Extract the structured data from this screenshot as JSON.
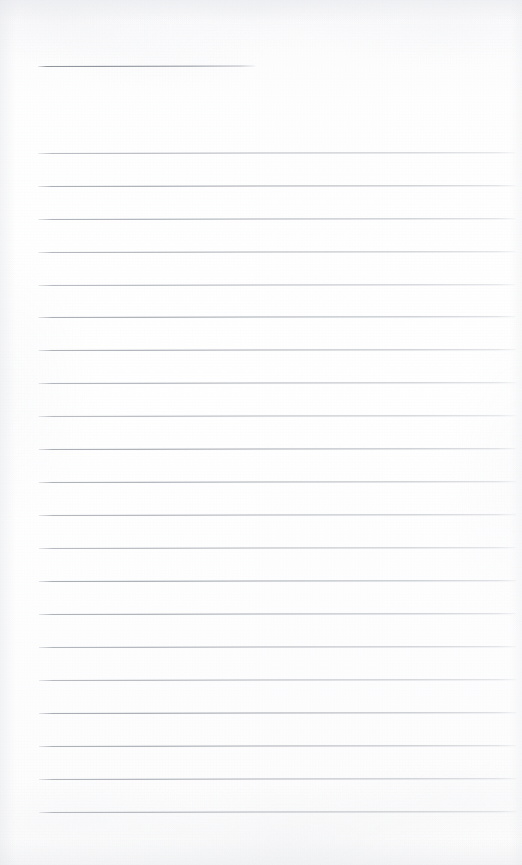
{
  "document": {
    "kind": "scanned-blank-lined-notebook-page",
    "page_width": 522,
    "page_height": 865,
    "background_color": "#fdfdfd",
    "rule_color": "#9ba0a8",
    "title_rule_color": "#868b95",
    "has_text": false,
    "text_content": "",
    "notes": "Blank ruled page. No printed words, numbers, headers, page numbers or handwriting are visible anywhere in the image."
  },
  "title_rule": {
    "name": "title-rule",
    "x": 38,
    "y": 66,
    "width": 217,
    "thickness": 1
  },
  "body_rules": {
    "left_x": 38,
    "right_x": 515,
    "width": 477,
    "spacing": 33,
    "thickness": 1,
    "count": 21,
    "y_positions": [
      153,
      186,
      219,
      252,
      285,
      317,
      350,
      383,
      416,
      449,
      482,
      515,
      548,
      581,
      614,
      647,
      680,
      713,
      746,
      779,
      812
    ]
  },
  "margins": {
    "top_blank": 66,
    "left": 38,
    "right": 7,
    "bottom_blank": 53
  }
}
